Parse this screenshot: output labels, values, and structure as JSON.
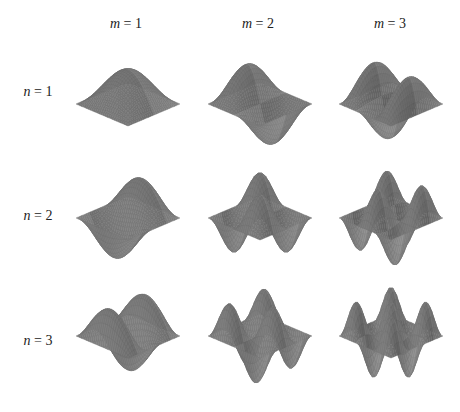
{
  "figure": {
    "column_labels": [
      {
        "var": "m",
        "eq": " = 1"
      },
      {
        "var": "m",
        "eq": " = 2"
      },
      {
        "var": "m",
        "eq": " = 3"
      }
    ],
    "row_labels": [
      {
        "var": "n",
        "eq": " = 1"
      },
      {
        "var": "n",
        "eq": " = 2"
      },
      {
        "var": "n",
        "eq": " = 3"
      }
    ],
    "colors": {
      "surface_dark": "#6b6b6b",
      "surface_mid": "#7d7d7d",
      "surface_light": "#9a9a9a",
      "background": "#ffffff"
    }
  },
  "chart_data": {
    "type": "surface-grid",
    "title": "",
    "columns": [
      "m = 1",
      "m = 2",
      "m = 3"
    ],
    "rows": [
      "n = 1",
      "n = 2",
      "n = 3"
    ],
    "cells": [
      {
        "m": 1,
        "n": 1,
        "shape": "single central hump"
      },
      {
        "m": 2,
        "n": 1,
        "shape": "one hump and one trough along m-direction"
      },
      {
        "m": 3,
        "n": 1,
        "shape": "two humps and one trough along m-direction"
      },
      {
        "m": 1,
        "n": 2,
        "shape": "one hump and one trough along n-direction"
      },
      {
        "m": 2,
        "n": 2,
        "shape": "2x2 checkerboard of humps/troughs"
      },
      {
        "m": 3,
        "n": 2,
        "shape": "3x2 checkerboard of humps/troughs"
      },
      {
        "m": 1,
        "n": 3,
        "shape": "two humps and one trough along n-direction"
      },
      {
        "m": 2,
        "n": 3,
        "shape": "2x3 checkerboard of humps/troughs"
      },
      {
        "m": 3,
        "n": 3,
        "shape": "3x3 checkerboard of humps/troughs"
      }
    ]
  }
}
